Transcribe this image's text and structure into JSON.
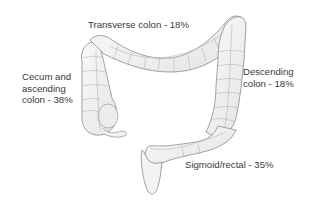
{
  "diagram": {
    "colors": {
      "background": "#ffffff",
      "colon_fill": "#f1f1f1",
      "colon_outline": "#8c8c8c",
      "haustra_lines": "#b5b5b5",
      "label_text": "#3a3a3a"
    },
    "regions": [
      {
        "id": "transverse",
        "label_lines": [
          "Transverse colon - 18%"
        ],
        "percent": 18
      },
      {
        "id": "cecum-ascending",
        "label_lines": [
          "Cecum and",
          "ascending",
          "colon - 38%"
        ],
        "percent": 38
      },
      {
        "id": "descending",
        "label_lines": [
          "Descending",
          "colon - 18%"
        ],
        "percent": 18
      },
      {
        "id": "sigmoid-rectal",
        "label_lines": [
          "Sigmoid/rectal - 35%"
        ],
        "percent": 35
      }
    ]
  }
}
